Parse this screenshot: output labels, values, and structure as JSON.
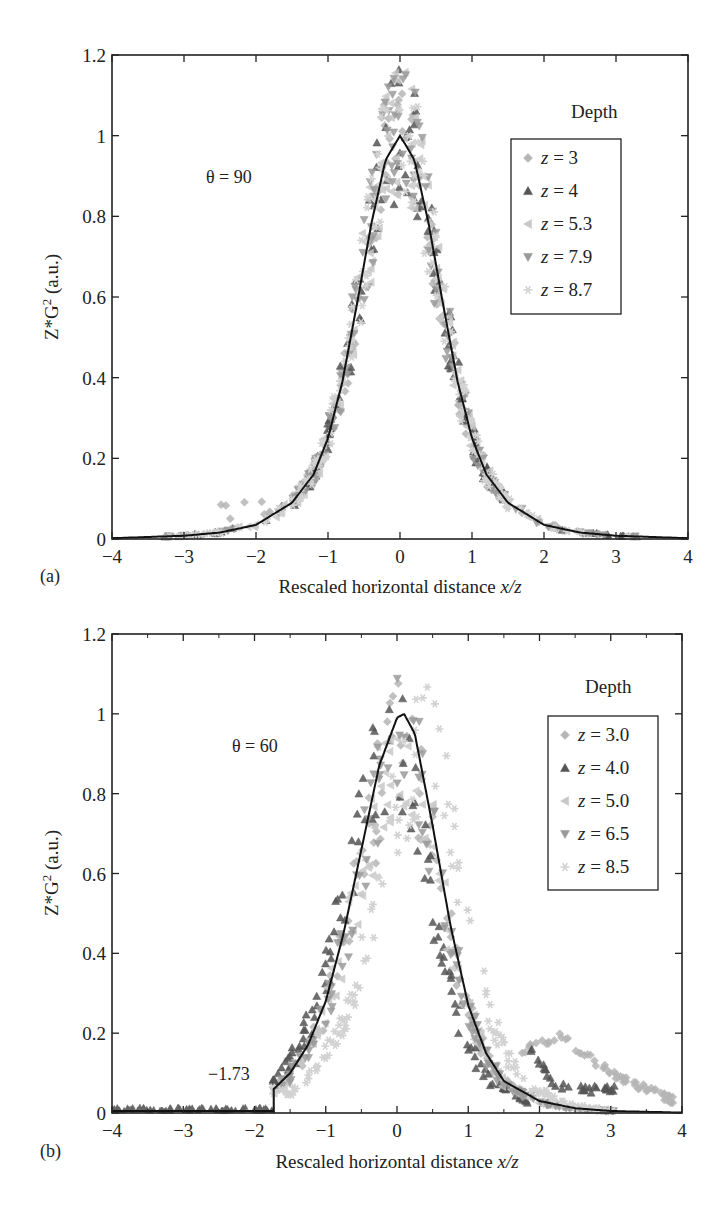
{
  "chart_data": [
    {
      "type": "scatter",
      "panel_label": "(a)",
      "annotation": "θ = 90",
      "xlabel": "Rescaled horizontal distance x/z",
      "xlabel_plain": "Rescaled horizontal distance ",
      "xlabel_italic": "x/z",
      "ylabel": "Z*G² (a.u.)",
      "xlim": [
        -4,
        4
      ],
      "ylim": [
        0,
        1.2
      ],
      "xticks": [
        "-4",
        "-3",
        "-2",
        "-1",
        "0",
        "1",
        "2",
        "3",
        "4"
      ],
      "yticks": [
        "0",
        "0.2",
        "0.4",
        "0.6",
        "0.8",
        "1",
        "1.2"
      ],
      "grid": false,
      "legend_title": "Depth",
      "legend_position": "upper right",
      "series": [
        {
          "name": "z = 3",
          "marker": "diamond",
          "color": "#b5b5b5"
        },
        {
          "name": "z = 4",
          "marker": "triangle-up",
          "color": "#555555"
        },
        {
          "name": "z = 5.3",
          "marker": "triangle-left",
          "color": "#c8c8c8"
        },
        {
          "name": "z = 7.9",
          "marker": "triangle-down",
          "color": "#9a9a9a"
        },
        {
          "name": "z = 8.7",
          "marker": "star",
          "color": "#d2d2d2"
        }
      ],
      "model_curve": {
        "description": "Lorentzian-like fit, peak 1.0 at x/z = 0",
        "x": [
          -4,
          -3,
          -2.5,
          -2,
          -1.5,
          -1.2,
          -1,
          -0.8,
          -0.6,
          -0.4,
          -0.2,
          0,
          0.2,
          0.4,
          0.6,
          0.8,
          1,
          1.2,
          1.5,
          2,
          2.5,
          3,
          4
        ],
        "y": [
          0.002,
          0.008,
          0.016,
          0.035,
          0.09,
          0.16,
          0.25,
          0.39,
          0.58,
          0.78,
          0.94,
          1.0,
          0.94,
          0.78,
          0.58,
          0.39,
          0.25,
          0.16,
          0.09,
          0.035,
          0.016,
          0.008,
          0.002
        ]
      },
      "data_envelope": {
        "peak_y_max": 1.2,
        "center_x": 0,
        "tail_left_bump": {
          "x": [
            -2.5,
            -1.5
          ],
          "y": [
            0.05,
            0.1
          ]
        },
        "outliers": [
          {
            "x": -2.4,
            "y": 0.14
          },
          {
            "x": 1.25,
            "y": 0.35
          },
          {
            "x": 2.35,
            "y": 0.03
          }
        ]
      }
    },
    {
      "type": "scatter",
      "panel_label": "(b)",
      "annotation": "θ = 60",
      "cutoff_label": "−1.73",
      "cutoff_x": -1.73,
      "xlabel": "Rescaled horizontal distance x/z",
      "xlabel_plain": "Rescaled horizontal distance ",
      "xlabel_italic": "x/z",
      "ylabel": "Z*G² (a.u.)",
      "xlim": [
        -4,
        4
      ],
      "ylim": [
        0,
        1.2
      ],
      "xticks": [
        "-4",
        "-3",
        "-2",
        "-1",
        "0",
        "1",
        "2",
        "3",
        "4"
      ],
      "yticks": [
        "0",
        "0.2",
        "0.4",
        "0.6",
        "0.8",
        "1",
        "1.2"
      ],
      "grid": false,
      "legend_title": "Depth",
      "legend_position": "upper right",
      "series": [
        {
          "name": "z = 3.0",
          "marker": "diamond",
          "color": "#b5b5b5"
        },
        {
          "name": "z = 4.0",
          "marker": "triangle-up",
          "color": "#555555"
        },
        {
          "name": "z = 5.0",
          "marker": "triangle-left",
          "color": "#c8c8c8"
        },
        {
          "name": "z = 6.5",
          "marker": "triangle-down",
          "color": "#9a9a9a"
        },
        {
          "name": "z = 8.5",
          "marker": "star",
          "color": "#d2d2d2"
        }
      ],
      "model_curve": {
        "description": "Asymmetric fit, peak 1.0 near x/z = 0.1, truncated at x/z = -1.73",
        "x": [
          -1.73,
          -1.5,
          -1.25,
          -1,
          -0.75,
          -0.5,
          -0.25,
          0,
          0.1,
          0.25,
          0.5,
          0.75,
          1,
          1.25,
          1.5,
          2,
          2.5,
          3,
          4
        ],
        "y": [
          0.06,
          0.1,
          0.17,
          0.28,
          0.45,
          0.66,
          0.87,
          0.99,
          1.0,
          0.95,
          0.72,
          0.47,
          0.27,
          0.15,
          0.08,
          0.03,
          0.012,
          0.005,
          0.001
        ]
      },
      "data_envelope": {
        "peak_y_max": 1.03,
        "center_x": 0,
        "right_tail_series_z3": {
          "x": [
            1.8,
            2.3,
            3,
            4
          ],
          "y": [
            0.16,
            0.19,
            0.1,
            0.02
          ]
        },
        "right_tail_series_z4": {
          "x": [
            1.9,
            2.2,
            2.6,
            3
          ],
          "y": [
            0.16,
            0.07,
            0.06,
            0.06
          ]
        }
      }
    }
  ]
}
